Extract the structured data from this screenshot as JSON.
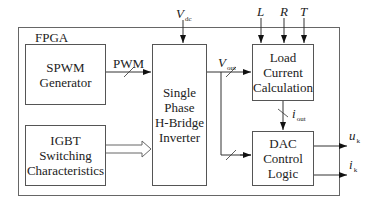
{
  "container": {
    "label": "FPGA"
  },
  "blocks": {
    "spwm": {
      "lines": [
        "SPWM",
        "Generator"
      ]
    },
    "igbt": {
      "lines": [
        "IGBT",
        "Switching",
        "Characteristics"
      ]
    },
    "inverter": {
      "lines": [
        "Single",
        "Phase",
        "H-Bridge",
        "Inverter"
      ]
    },
    "load": {
      "lines": [
        "Load",
        "Current",
        "Calculation"
      ]
    },
    "dac": {
      "lines": [
        "DAC",
        "Control",
        "Logic"
      ]
    }
  },
  "signals": {
    "pwm": "PWM",
    "vdc": {
      "main": "V",
      "sub": "dc"
    },
    "vout": {
      "main": "V",
      "sub": "out"
    },
    "iout": {
      "main": "i",
      "sub": "out"
    },
    "L": "L",
    "R": "R",
    "T": "T",
    "uk": {
      "main": "u",
      "sub": "k"
    },
    "ik": {
      "main": "i",
      "sub": "k"
    }
  }
}
